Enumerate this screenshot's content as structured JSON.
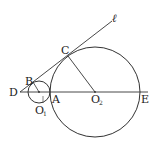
{
  "diagram": {
    "type": "geometry",
    "colors": {
      "stroke": "#333333",
      "text": "#222222",
      "background": "#ffffff"
    },
    "points": {
      "D": {
        "label": "D"
      },
      "B": {
        "label": "B"
      },
      "C": {
        "label": "C"
      },
      "A": {
        "label": "A"
      },
      "O1": {
        "label": "O",
        "sub": "1"
      },
      "O2": {
        "label": "O",
        "sub": "2"
      },
      "E": {
        "label": "E"
      }
    },
    "line_label": "ℓ",
    "circles": [
      {
        "name": "circle-O1",
        "center": "O1"
      },
      {
        "name": "circle-O2",
        "center": "O2"
      }
    ],
    "segments": [
      "D-E",
      "D-ℓ",
      "O2-C",
      "O1-B"
    ]
  }
}
